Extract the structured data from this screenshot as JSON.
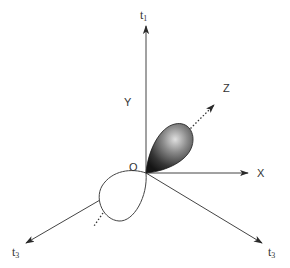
{
  "diagram": {
    "type": "3D coordinate axes with orbital lobes",
    "labels": {
      "t1": {
        "main": "t",
        "sub": "1"
      },
      "t3_left": {
        "main": "t",
        "sub": "3"
      },
      "t3_right": {
        "main": "t",
        "sub": "3"
      },
      "y": "Y",
      "z": "Z",
      "x": "X",
      "origin": "O"
    },
    "origin": [
      146,
      173
    ],
    "axes": [
      {
        "name": "t1",
        "from": [
          146,
          173
        ],
        "to": [
          146,
          25
        ],
        "style": "solid"
      },
      {
        "name": "X",
        "from": [
          146,
          173
        ],
        "to": [
          248,
          173
        ],
        "style": "solid"
      },
      {
        "name": "t3-right",
        "from": [
          146,
          173
        ],
        "to": [
          262,
          243
        ],
        "style": "solid"
      },
      {
        "name": "t3-left",
        "from": [
          146,
          173
        ],
        "to": [
          26,
          243
        ],
        "style": "solid"
      },
      {
        "name": "Z",
        "from": [
          146,
          173
        ],
        "to": [
          215,
          103
        ],
        "style": "dotted"
      }
    ],
    "lobes": [
      {
        "name": "shaded-lobe",
        "fill": "gradient-dark",
        "direction": "upper-right"
      },
      {
        "name": "open-lobe",
        "fill": "#ffffff",
        "direction": "lower-left"
      }
    ],
    "colors": {
      "line": "#444444",
      "lobe_dark": "#1e1e1e",
      "lobe_light": "#d8d8d8",
      "text": "#333333"
    }
  }
}
